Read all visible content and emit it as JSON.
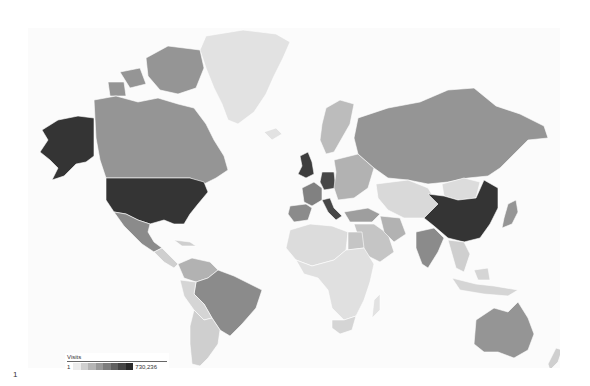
{
  "map": {
    "type": "choropleth",
    "metric": "Visits",
    "color_scale": {
      "min_value": 1,
      "max_value": 730236,
      "min_color": "#ececec",
      "max_color": "#2a2a2a",
      "steps": 8
    },
    "regions": [
      {
        "id": "greenland",
        "name": "Greenland",
        "level": 0.05
      },
      {
        "id": "canada",
        "name": "Canada",
        "level": 0.45
      },
      {
        "id": "canada-arctic",
        "name": "Canada (Arctic islands)",
        "level": 0.45
      },
      {
        "id": "usa",
        "name": "United States",
        "level": 0.95
      },
      {
        "id": "alaska",
        "name": "United States (Alaska)",
        "level": 0.95
      },
      {
        "id": "mexico",
        "name": "Mexico",
        "level": 0.5
      },
      {
        "id": "central-america",
        "name": "Central America",
        "level": 0.15
      },
      {
        "id": "colombia-venezuela",
        "name": "Colombia / Venezuela",
        "level": 0.3
      },
      {
        "id": "brazil",
        "name": "Brazil",
        "level": 0.5
      },
      {
        "id": "peru-bolivia",
        "name": "Peru / Bolivia",
        "level": 0.12
      },
      {
        "id": "argentina-chile",
        "name": "Argentina / Chile",
        "level": 0.15
      },
      {
        "id": "uk",
        "name": "United Kingdom",
        "level": 0.9
      },
      {
        "id": "france",
        "name": "France",
        "level": 0.55
      },
      {
        "id": "spain",
        "name": "Spain",
        "level": 0.5
      },
      {
        "id": "germany",
        "name": "Germany",
        "level": 0.85
      },
      {
        "id": "italy",
        "name": "Italy",
        "level": 0.85
      },
      {
        "id": "scandinavia",
        "name": "Scandinavia",
        "level": 0.25
      },
      {
        "id": "eastern-europe",
        "name": "Eastern Europe",
        "level": 0.3
      },
      {
        "id": "russia",
        "name": "Russia",
        "level": 0.45
      },
      {
        "id": "turkey",
        "name": "Turkey",
        "level": 0.4
      },
      {
        "id": "middle-east",
        "name": "Middle East",
        "level": 0.2
      },
      {
        "id": "iran",
        "name": "Iran",
        "level": 0.3
      },
      {
        "id": "central-asia",
        "name": "Central Asia",
        "level": 0.1
      },
      {
        "id": "mongolia",
        "name": "Mongolia",
        "level": 0.08
      },
      {
        "id": "china",
        "name": "China",
        "level": 0.95
      },
      {
        "id": "india",
        "name": "India",
        "level": 0.5
      },
      {
        "id": "japan",
        "name": "Japan",
        "level": 0.45
      },
      {
        "id": "southeast-asia",
        "name": "Southeast Asia",
        "level": 0.15
      },
      {
        "id": "indonesia",
        "name": "Indonesia",
        "level": 0.12
      },
      {
        "id": "australia",
        "name": "Australia",
        "level": 0.45
      },
      {
        "id": "new-zealand",
        "name": "New Zealand",
        "level": 0.15
      },
      {
        "id": "africa-north",
        "name": "North Africa",
        "level": 0.08
      },
      {
        "id": "egypt",
        "name": "Egypt",
        "level": 0.2
      },
      {
        "id": "africa-sub",
        "name": "Sub-Saharan Africa",
        "level": 0.06
      },
      {
        "id": "south-africa",
        "name": "South Africa",
        "level": 0.12
      },
      {
        "id": "madagascar",
        "name": "Madagascar",
        "level": 0.05
      },
      {
        "id": "iceland",
        "name": "Iceland",
        "level": 0.05
      }
    ]
  },
  "legend": {
    "title": "Visits",
    "min_label": "1",
    "max_label": "730,236"
  },
  "footer": {
    "page_number": "1"
  }
}
